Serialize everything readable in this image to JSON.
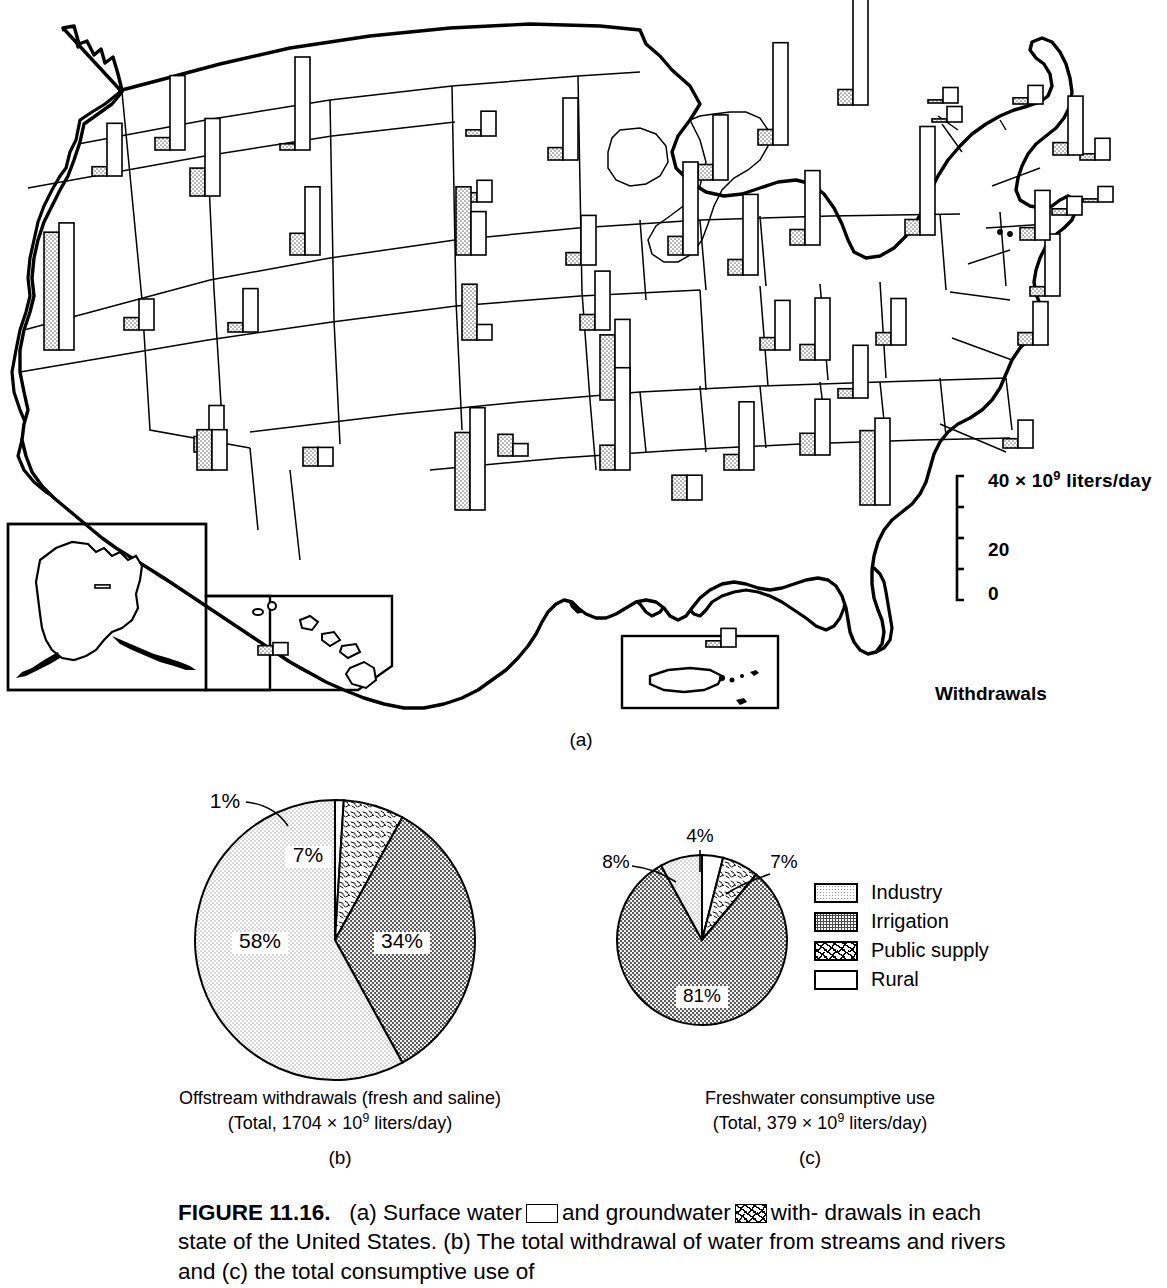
{
  "figure": {
    "number": "FIGURE 11.16.",
    "caption_line1_a": "(a) Surface water",
    "caption_line1_b": "and groundwater",
    "caption_line1_c": "with-",
    "caption_line2": "drawals in each state of the United States. (b) The total withdrawal of",
    "caption_line3": "water from streams and rivers and (c) the total consumptive use of"
  },
  "panels": {
    "a": "(a)",
    "b": "(b)",
    "c": "(c)"
  },
  "map": {
    "title": "Withdrawals",
    "scale": {
      "top_label": "40",
      "units": "× 10",
      "units_exp": "9",
      "units_rest": " liters/day",
      "mid_label": "20",
      "bottom_label": "0",
      "ticks": [
        0,
        10,
        20,
        30,
        40
      ],
      "max": 40
    },
    "series": [
      {
        "name": "Surface water",
        "pattern": "white"
      },
      {
        "name": "Groundwater",
        "pattern": "stipple"
      }
    ],
    "note": "Paired bars per state: stippled = groundwater (left), white = surface water (right)",
    "states": [
      {
        "id": "WA",
        "gw": 4,
        "sw": 24,
        "x": 155,
        "y": 150,
        "lead": null
      },
      {
        "id": "OR",
        "gw": 3,
        "sw": 17,
        "x": 92,
        "y": 176,
        "lead": null
      },
      {
        "id": "CA",
        "gw": 38,
        "sw": 41,
        "x": 44,
        "y": 350,
        "lead": null
      },
      {
        "id": "ID",
        "gw": 9,
        "sw": 25,
        "x": 190,
        "y": 196,
        "lead": null
      },
      {
        "id": "NV",
        "gw": 4,
        "sw": 10,
        "x": 124,
        "y": 330,
        "lead": null
      },
      {
        "id": "MT",
        "gw": 2,
        "sw": 30,
        "x": 280,
        "y": 150,
        "lead": null
      },
      {
        "id": "WY",
        "gw": 3,
        "sw": 14,
        "x": 228,
        "y": 332,
        "lead": null
      },
      {
        "id": "UT",
        "gw": 5,
        "sw": 15,
        "x": 194,
        "y": 452,
        "lead": null
      },
      {
        "id": "AZ",
        "gw": 13,
        "sw": 13,
        "x": 197,
        "y": 470,
        "lead": null
      },
      {
        "id": "CO",
        "gw": 7,
        "sw": 22,
        "x": 290,
        "y": 255,
        "lead": null
      },
      {
        "id": "NM",
        "gw": 6,
        "sw": 6,
        "x": 303,
        "y": 466,
        "lead": null
      },
      {
        "id": "ND",
        "gw": 2,
        "sw": 8,
        "x": 466,
        "y": 136,
        "lead": null
      },
      {
        "id": "SD",
        "gw": 3,
        "sw": 7,
        "x": 462,
        "y": 202,
        "lead": null
      },
      {
        "id": "NE",
        "gw": 22,
        "sw": 14,
        "x": 456,
        "y": 255,
        "lead": null
      },
      {
        "id": "KS",
        "gw": 18,
        "sw": 5,
        "x": 462,
        "y": 340,
        "lead": null
      },
      {
        "id": "OK",
        "gw": 7,
        "sw": 4,
        "x": 498,
        "y": 456,
        "lead": null
      },
      {
        "id": "TX",
        "gw": 25,
        "sw": 33,
        "x": 455,
        "y": 510,
        "lead": null
      },
      {
        "id": "MN",
        "gw": 4,
        "sw": 20,
        "x": 548,
        "y": 160,
        "lead": null
      },
      {
        "id": "IA",
        "gw": 4,
        "sw": 16,
        "x": 566,
        "y": 265,
        "lead": null
      },
      {
        "id": "MO",
        "gw": 5,
        "sw": 19,
        "x": 580,
        "y": 330,
        "lead": null
      },
      {
        "id": "AR",
        "gw": 21,
        "sw": 26,
        "x": 600,
        "y": 400,
        "lead": null
      },
      {
        "id": "LA",
        "gw": 8,
        "sw": 33,
        "x": 600,
        "y": 470,
        "lead": null
      },
      {
        "id": "WI",
        "gw": 5,
        "sw": 21,
        "x": 698,
        "y": 180,
        "lead": null
      },
      {
        "id": "IL",
        "gw": 6,
        "sw": 30,
        "x": 668,
        "y": 255,
        "lead": null
      },
      {
        "id": "MI",
        "gw": 5,
        "sw": 33,
        "x": 758,
        "y": 145,
        "lead": null
      },
      {
        "id": "IN",
        "gw": 5,
        "sw": 26,
        "x": 728,
        "y": 275,
        "lead": null
      },
      {
        "id": "OH",
        "gw": 5,
        "sw": 24,
        "x": 790,
        "y": 245,
        "lead": null
      },
      {
        "id": "KY",
        "gw": 4,
        "sw": 16,
        "x": 760,
        "y": 350,
        "lead": null
      },
      {
        "id": "TN",
        "gw": 5,
        "sw": 20,
        "x": 800,
        "y": 360,
        "lead": null
      },
      {
        "id": "MS",
        "gw": 8,
        "sw": 8,
        "x": 672,
        "y": 500,
        "lead": null
      },
      {
        "id": "AL",
        "gw": 5,
        "sw": 22,
        "x": 724,
        "y": 470,
        "lead": null
      },
      {
        "id": "GA",
        "gw": 7,
        "sw": 18,
        "x": 800,
        "y": 455,
        "lead": null
      },
      {
        "id": "FL",
        "gw": 24,
        "sw": 28,
        "x": 860,
        "y": 505,
        "lead": null
      },
      {
        "id": "SC",
        "gw": 3,
        "sw": 17,
        "x": 838,
        "y": 398,
        "lead": null
      },
      {
        "id": "NC",
        "gw": 4,
        "sw": 15,
        "x": 876,
        "y": 345,
        "lead": null
      },
      {
        "id": "VA",
        "gw": 4,
        "sw": 14,
        "x": 1018,
        "y": 345,
        "lead": "VA"
      },
      {
        "id": "WV",
        "gw": 3,
        "sw": 9,
        "x": 1003,
        "y": 448,
        "lead": "WV"
      },
      {
        "id": "PA",
        "gw": 5,
        "sw": 35,
        "x": 905,
        "y": 235,
        "lead": null
      },
      {
        "id": "NY",
        "gw": 5,
        "sw": 35,
        "x": 838,
        "y": 105,
        "lead": null
      },
      {
        "id": "MD",
        "gw": 3,
        "sw": 20,
        "x": 1030,
        "y": 296,
        "lead": "MD"
      },
      {
        "id": "DE",
        "gw": 2,
        "sw": 6,
        "x": 1052,
        "y": 215,
        "lead": "DE"
      },
      {
        "id": "NJ",
        "gw": 4,
        "sw": 16,
        "x": 1020,
        "y": 240,
        "lead": "NJ"
      },
      {
        "id": "CT",
        "gw": 2,
        "sw": 7,
        "x": 1080,
        "y": 160,
        "lead": "CT"
      },
      {
        "id": "RI",
        "gw": 1,
        "sw": 5,
        "x": 1083,
        "y": 202,
        "lead": "RI"
      },
      {
        "id": "MA",
        "gw": 4,
        "sw": 19,
        "x": 1053,
        "y": 155,
        "lead": "MA"
      },
      {
        "id": "VT",
        "gw": 1,
        "sw": 5,
        "x": 932,
        "y": 122,
        "lead": "VT"
      },
      {
        "id": "NH",
        "gw": 1,
        "sw": 5,
        "x": 928,
        "y": 103,
        "lead": "NH"
      },
      {
        "id": "ME",
        "gw": 2,
        "sw": 6,
        "x": 1013,
        "y": 104,
        "lead": null
      },
      {
        "id": "AK",
        "gw": 0,
        "sw": 1,
        "x": 80,
        "y": 588,
        "lead": null
      },
      {
        "id": "HI",
        "gw": 3,
        "sw": 4,
        "x": 258,
        "y": 655,
        "lead": null
      },
      {
        "id": "PR",
        "gw": 2,
        "sw": 6,
        "x": 706,
        "y": 647,
        "lead": null
      }
    ]
  },
  "chart_data": [
    {
      "type": "pie",
      "id": "b",
      "title": "Offstream withdrawals (fresh and saline)",
      "subtitle_prefix": "(Total, 1704 ",
      "subtitle_mult": "× 10",
      "subtitle_exp": "9",
      "subtitle_suffix": " liters/day)",
      "total_value": 1704,
      "total_units": "× 10^9 liters/day",
      "categories": [
        "Rural",
        "Public supply",
        "Irrigation",
        "Industry"
      ],
      "values": [
        1,
        7,
        34,
        58
      ],
      "labels": [
        "1%",
        "7%",
        "34%",
        "58%"
      ],
      "patterns": [
        "white",
        "speckle",
        "dark-dots",
        "light-dots"
      ],
      "start_angle_deg": 0,
      "direction": "clockwise"
    },
    {
      "type": "pie",
      "id": "c",
      "title": "Freshwater consumptive use",
      "subtitle_prefix": "(Total, 379 ",
      "subtitle_mult": "× 10",
      "subtitle_exp": "9",
      "subtitle_suffix": " liters/day)",
      "total_value": 379,
      "total_units": "× 10^9 liters/day",
      "categories": [
        "Rural",
        "Public supply",
        "Irrigation",
        "Industry"
      ],
      "values": [
        4,
        7,
        81,
        8
      ],
      "labels": [
        "4%",
        "7%",
        "81%",
        "8%"
      ],
      "patterns": [
        "white",
        "speckle",
        "dark-dots",
        "light-dots"
      ],
      "start_angle_deg": 0,
      "direction": "clockwise"
    }
  ],
  "legend": {
    "items": [
      {
        "label": "Industry",
        "pattern": "light-dots"
      },
      {
        "label": "Irrigation",
        "pattern": "dark-dots"
      },
      {
        "label": "Public supply",
        "pattern": "speckle"
      },
      {
        "label": "Rural",
        "pattern": "white"
      }
    ]
  }
}
